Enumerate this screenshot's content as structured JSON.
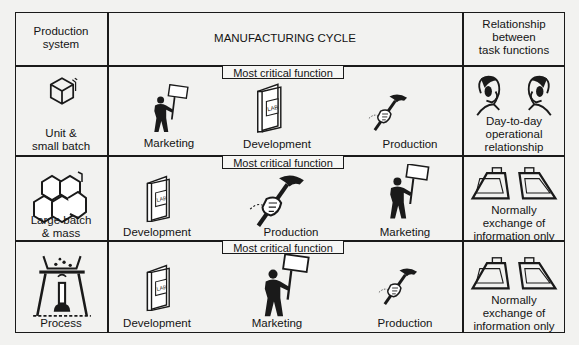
{
  "header": {
    "production_system": [
      "Production",
      "system"
    ],
    "manufacturing_cycle": "MANUFACTURING CYCLE",
    "relationship": [
      "Relationship",
      "between",
      "task functions"
    ]
  },
  "critical_label": "Most critical function",
  "rows": [
    {
      "system": [
        "Unit &",
        "small batch"
      ],
      "system_icon": "single-box-icon",
      "functions": [
        "Marketing",
        "Development",
        "Production"
      ],
      "critical": "Development",
      "relationship": [
        "Day-to-day",
        "operational",
        "relationship"
      ],
      "relationship_icon": "two-people-on-phone-icon"
    },
    {
      "system": [
        "Large batch",
        "& mass"
      ],
      "system_icon": "stacked-boxes-icon",
      "functions": [
        "Development",
        "Production",
        "Marketing"
      ],
      "critical": "Production",
      "relationship": [
        "Normally",
        "exchange of",
        "information only"
      ],
      "relationship_icon": "in-out-trays-icon"
    },
    {
      "system": [
        "Process"
      ],
      "system_icon": "bunsen-burner-icon",
      "functions": [
        "Development",
        "Marketing",
        "Production"
      ],
      "critical": "Marketing",
      "relationship": [
        "Normally",
        "exchange of",
        "information only"
      ],
      "relationship_icon": "in-out-trays-icon"
    }
  ],
  "icon_text": {
    "lab": "LAB"
  },
  "colors": {
    "ink": "#1a1a1a",
    "paper": "#f2f2f0"
  }
}
